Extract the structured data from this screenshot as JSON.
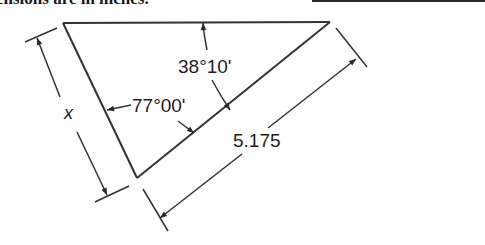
{
  "header": {
    "text": "Dimensions are in inches.",
    "visible_text": "ensions are in inches."
  },
  "answer_blank": {
    "present": true
  },
  "diagram": {
    "type": "triangle-dimension-drawing",
    "labels": {
      "angle_top": "38°10'",
      "angle_left": "77°00'",
      "hypotenuse_length": "5.175",
      "unknown_side": "x"
    },
    "units": "inches",
    "colors": {
      "line": "#333333",
      "text": "#1e1e1e",
      "background": "#ffffff"
    }
  }
}
